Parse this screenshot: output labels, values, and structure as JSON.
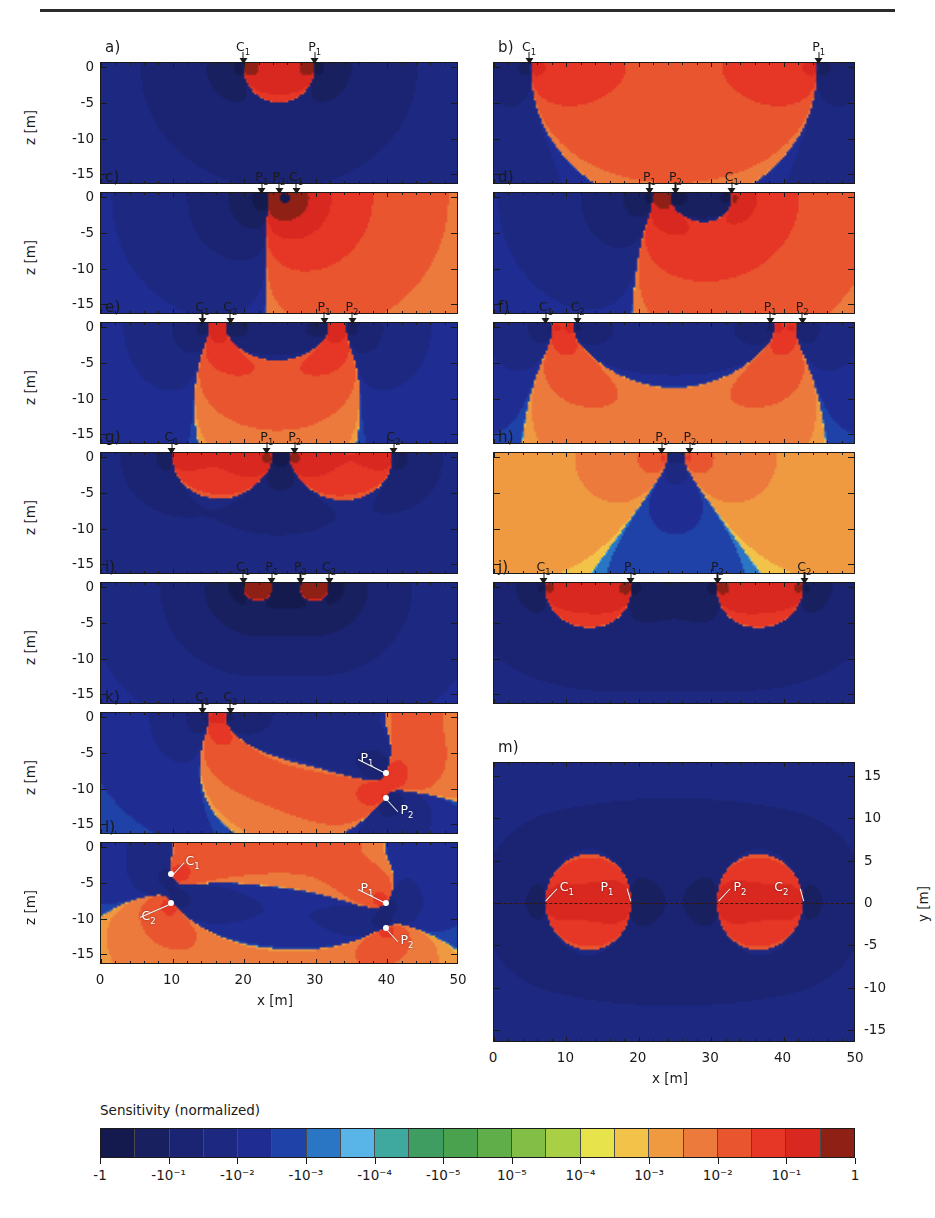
{
  "figure": {
    "axis_x_title": "x [m]",
    "axis_z_title": "z [m]",
    "axis_y_title": "y [m]",
    "x_ticks": [
      "0",
      "10",
      "20",
      "30",
      "40",
      "50"
    ],
    "z_ticks": [
      "0",
      "-5",
      "-10",
      "-15"
    ],
    "y_ticks": [
      "15",
      "10",
      "5",
      "0",
      "-5",
      "-10",
      "-15"
    ],
    "x_range": [
      0,
      50
    ],
    "z_range": [
      -16.5,
      0.6
    ],
    "y_range": [
      -16.5,
      16.5
    ]
  },
  "colorbar": {
    "title": "Sensitivity (normalized)",
    "tick_labels": [
      "-1",
      "-10⁻¹",
      "-10⁻²",
      "-10⁻³",
      "-10⁻⁴",
      "-10⁻⁵",
      "10⁻⁵",
      "10⁻⁴",
      "10⁻³",
      "10⁻²",
      "10⁻¹",
      "1"
    ],
    "tick_values": [
      -1,
      -0.1,
      -0.01,
      -0.001,
      -0.0001,
      -1e-05,
      1e-05,
      0.0001,
      0.001,
      0.01,
      0.1,
      1
    ],
    "n_swatches": 22,
    "colors": [
      "#151a4e",
      "#182060",
      "#1b2472",
      "#1d2880",
      "#1f2d92",
      "#1f42a8",
      "#2b76c4",
      "#59b5e8",
      "#3fa9a0",
      "#3f9d62",
      "#4aa24f",
      "#5fae4a",
      "#83bf47",
      "#a9cf45",
      "#e7e34a",
      "#f3c248",
      "#ef9a41",
      "#ec7a3c",
      "#e8552f",
      "#e53626",
      "#d82820",
      "#8f2016"
    ]
  },
  "chart_data": {
    "type": "heatmap",
    "title": "Sensitivity (normalized)",
    "xlabel": "x [m]",
    "ylabel": "z [m]",
    "xlim": [
      0,
      50
    ],
    "ylim": [
      -16.5,
      0.6
    ],
    "grid": false,
    "legend": "colorbar-below",
    "colorscale_type": "symmetric-log",
    "colorscale_ticks": [
      -1,
      -0.1,
      -0.01,
      -0.001,
      -0.0001,
      -1e-05,
      1e-05,
      0.0001,
      0.001,
      0.01,
      0.1,
      1
    ],
    "panels": [
      {
        "id": "a",
        "label": "a)",
        "column": "left",
        "plane": "xz",
        "electrodes": [
          {
            "name": "C",
            "sub": "1",
            "x": 20
          },
          {
            "name": "P",
            "sub": "1",
            "x": 30
          }
        ],
        "description": "two-electrode pole-pole; negative lobe between C1 and P1, positive flanks"
      },
      {
        "id": "b",
        "label": "b)",
        "column": "right",
        "plane": "xz",
        "electrodes": [
          {
            "name": "C",
            "sub": "1",
            "x": 5
          },
          {
            "name": "P",
            "sub": "1",
            "x": 45
          }
        ],
        "description": "wide pole-pole; broad negative region spanning the whole section"
      },
      {
        "id": "c",
        "label": "c)",
        "column": "left",
        "plane": "xz",
        "electrodes": [
          {
            "name": "P",
            "sub": "1",
            "x": 23.5
          },
          {
            "name": "P",
            "sub": "2",
            "x": 25
          },
          {
            "name": "C",
            "sub": "1",
            "x": 26.5
          }
        ],
        "description": "pole-dipole, small spacing; compact shallow anomaly"
      },
      {
        "id": "d",
        "label": "d)",
        "column": "right",
        "plane": "xz",
        "electrodes": [
          {
            "name": "P",
            "sub": "1",
            "x": 22
          },
          {
            "name": "P",
            "sub": "2",
            "x": 24.5
          },
          {
            "name": "C",
            "sub": "1",
            "x": 33
          }
        ],
        "description": "pole-dipole, larger spacing"
      },
      {
        "id": "e",
        "label": "e)",
        "column": "left",
        "plane": "xz",
        "electrodes": [
          {
            "name": "C",
            "sub": "1",
            "x": 15
          },
          {
            "name": "C",
            "sub": "2",
            "x": 17.5
          },
          {
            "name": "P",
            "sub": "1",
            "x": 32
          },
          {
            "name": "P",
            "sub": "2",
            "x": 34.5
          }
        ],
        "description": "dipole-dipole; two positive plumes beneath the dipoles"
      },
      {
        "id": "f",
        "label": "f)",
        "column": "right",
        "plane": "xz",
        "electrodes": [
          {
            "name": "C",
            "sub": "1",
            "x": 8
          },
          {
            "name": "C",
            "sub": "2",
            "x": 11
          },
          {
            "name": "P",
            "sub": "1",
            "x": 39
          },
          {
            "name": "P",
            "sub": "2",
            "x": 42
          }
        ],
        "description": "dipole-dipole, wider separation"
      },
      {
        "id": "g",
        "label": "g)",
        "column": "left",
        "plane": "xz",
        "electrodes": [
          {
            "name": "C",
            "sub": "1",
            "x": 10
          },
          {
            "name": "P",
            "sub": "1",
            "x": 24
          },
          {
            "name": "P",
            "sub": "2",
            "x": 26.5
          },
          {
            "name": "C",
            "sub": "2",
            "x": 41
          }
        ],
        "description": "Schlumberger/gradient; central positive plume, flanking negatives"
      },
      {
        "id": "h",
        "label": "h)",
        "column": "right",
        "plane": "xz",
        "electrodes": [
          {
            "name": "P",
            "sub": "1",
            "x": 24
          },
          {
            "name": "P",
            "sub": "2",
            "x": 26.5
          }
        ],
        "description": "dipole only; narrow central positive wedge"
      },
      {
        "id": "i",
        "label": "i)",
        "column": "left",
        "plane": "xz",
        "electrodes": [
          {
            "name": "C",
            "sub": "1",
            "x": 20
          },
          {
            "name": "P",
            "sub": "1",
            "x": 24
          },
          {
            "name": "P",
            "sub": "2",
            "x": 28
          },
          {
            "name": "C",
            "sub": "2",
            "x": 32
          }
        ],
        "description": "Wenner, small spacing; shallow concentrated positive"
      },
      {
        "id": "j",
        "label": "j)",
        "column": "right",
        "plane": "xz",
        "electrodes": [
          {
            "name": "C",
            "sub": "1",
            "x": 7
          },
          {
            "name": "P",
            "sub": "1",
            "x": 19
          },
          {
            "name": "P",
            "sub": "2",
            "x": 31
          },
          {
            "name": "C",
            "sub": "2",
            "x": 43
          }
        ],
        "description": "Wenner, wide spacing; three negative lobes, broad positive"
      },
      {
        "id": "k",
        "label": "k)",
        "column": "left",
        "plane": "xz",
        "electrodes": [
          {
            "name": "C",
            "sub": "1",
            "x": 15
          },
          {
            "name": "C",
            "sub": "2",
            "x": 17.5
          }
        ],
        "buried": [
          {
            "name": "P",
            "sub": "1",
            "x": 40,
            "z": -8
          },
          {
            "name": "P",
            "sub": "2",
            "x": 40,
            "z": -11.5
          }
        ],
        "description": "surface current dipole with buried potential dipole; inclined lobes"
      },
      {
        "id": "l",
        "label": "l)",
        "column": "left",
        "plane": "xz",
        "buried": [
          {
            "name": "C",
            "sub": "1",
            "x": 10,
            "z": -4
          },
          {
            "name": "C",
            "sub": "2",
            "x": 10,
            "z": -8
          },
          {
            "name": "P",
            "sub": "1",
            "x": 40,
            "z": -8
          },
          {
            "name": "P",
            "sub": "2",
            "x": 40,
            "z": -11.5
          }
        ],
        "description": "cross-hole: buried current dipole and buried potential dipole"
      },
      {
        "id": "m",
        "label": "m)",
        "column": "right",
        "plane": "xy",
        "buried": [
          {
            "name": "C",
            "sub": "1",
            "x": 7,
            "y": 0
          },
          {
            "name": "P",
            "sub": "1",
            "x": 19,
            "y": 0
          },
          {
            "name": "P",
            "sub": "2",
            "x": 31,
            "y": 0
          },
          {
            "name": "C",
            "sub": "2",
            "x": 43,
            "y": 0
          }
        ],
        "description": "map (x-y plane) view of Wenner array sensitivity at depth; dashed profile line at y=0"
      }
    ]
  }
}
